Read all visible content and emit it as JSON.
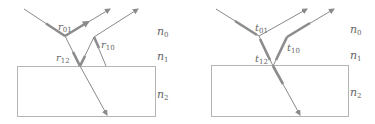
{
  "colors": {
    "line": "#8a8a8a",
    "thick": "#8c8c8c",
    "box": "#b4b4b4",
    "label": "#666666"
  },
  "panels": [
    {
      "name": "reflection",
      "labels": {
        "r01": {
          "base": "r",
          "sub": "01"
        },
        "r10": {
          "base": "r",
          "sub": "10"
        },
        "r12": {
          "base": "r",
          "sub": "12"
        }
      },
      "media": [
        {
          "base": "n",
          "sub": "0"
        },
        {
          "base": "n",
          "sub": "1"
        },
        {
          "base": "n",
          "sub": "2"
        }
      ]
    },
    {
      "name": "transmission",
      "labels": {
        "t01": {
          "base": "t",
          "sub": "01"
        },
        "t10": {
          "base": "t",
          "sub": "10"
        },
        "t12": {
          "base": "t",
          "sub": "12"
        }
      },
      "media": [
        {
          "base": "n",
          "sub": "0"
        },
        {
          "base": "n",
          "sub": "1"
        },
        {
          "base": "n",
          "sub": "2"
        }
      ]
    }
  ]
}
